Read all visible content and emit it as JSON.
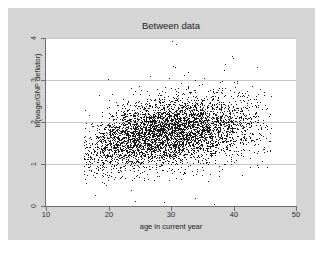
{
  "chart_data": {
    "type": "scatter",
    "title": "Between data",
    "xlabel": "age in current year",
    "ylabel": "ln(wage/GNP deflator)",
    "xlim": [
      10,
      50
    ],
    "ylim": [
      0,
      4
    ],
    "xticks": [
      10,
      20,
      30,
      40,
      50
    ],
    "yticks": [
      0,
      1,
      2,
      3,
      4
    ],
    "xtick_labels": [
      "10",
      "20",
      "30",
      "40",
      "50"
    ],
    "ytick_labels": [
      "0",
      "1",
      "2",
      "3",
      "4"
    ],
    "grid": "horizontal",
    "legend": "none",
    "marker": {
      "shape": "dot",
      "size": 1,
      "color": "#1a1a1a"
    },
    "n_points": 4711,
    "x_data_range": [
      16,
      46
    ],
    "y_data_range": [
      0,
      4
    ],
    "cluster_center": [
      29.5,
      1.72
    ],
    "trend": "increasing",
    "approx_slope_per_year": 0.022,
    "point_cloud_summary": [
      {
        "age_bin": "16-18",
        "n": 95,
        "y_mean": 1.25,
        "y_sd": 0.34
      },
      {
        "age_bin": "18-20",
        "n": 190,
        "y_mean": 1.38,
        "y_sd": 0.36
      },
      {
        "age_bin": "20-22",
        "n": 300,
        "y_mean": 1.5,
        "y_sd": 0.36
      },
      {
        "age_bin": "22-24",
        "n": 390,
        "y_mean": 1.58,
        "y_sd": 0.36
      },
      {
        "age_bin": "24-26",
        "n": 470,
        "y_mean": 1.64,
        "y_sd": 0.36
      },
      {
        "age_bin": "26-28",
        "n": 520,
        "y_mean": 1.7,
        "y_sd": 0.37
      },
      {
        "age_bin": "28-30",
        "n": 540,
        "y_mean": 1.74,
        "y_sd": 0.37
      },
      {
        "age_bin": "30-32",
        "n": 520,
        "y_mean": 1.78,
        "y_sd": 0.38
      },
      {
        "age_bin": "32-34",
        "n": 460,
        "y_mean": 1.82,
        "y_sd": 0.38
      },
      {
        "age_bin": "34-36",
        "n": 390,
        "y_mean": 1.85,
        "y_sd": 0.39
      },
      {
        "age_bin": "36-38",
        "n": 310,
        "y_mean": 1.87,
        "y_sd": 0.39
      },
      {
        "age_bin": "38-40",
        "n": 230,
        "y_mean": 1.89,
        "y_sd": 0.4
      },
      {
        "age_bin": "40-42",
        "n": 160,
        "y_mean": 1.9,
        "y_sd": 0.4
      },
      {
        "age_bin": "42-44",
        "n": 95,
        "y_mean": 1.91,
        "y_sd": 0.41
      },
      {
        "age_bin": "44-46",
        "n": 41,
        "y_mean": 1.92,
        "y_sd": 0.41
      }
    ],
    "notable_outliers": [
      {
        "x": 30.1,
        "y": 3.92
      },
      {
        "x": 30.8,
        "y": 3.86
      },
      {
        "x": 39.7,
        "y": 3.58
      },
      {
        "x": 39.9,
        "y": 3.52
      },
      {
        "x": 30.3,
        "y": 3.33
      },
      {
        "x": 38.5,
        "y": 3.24
      },
      {
        "x": 28.9,
        "y": 0.09
      },
      {
        "x": 36.9,
        "y": 0.05
      },
      {
        "x": 24.2,
        "y": 0.12
      },
      {
        "x": 33.8,
        "y": 0.18
      }
    ]
  }
}
